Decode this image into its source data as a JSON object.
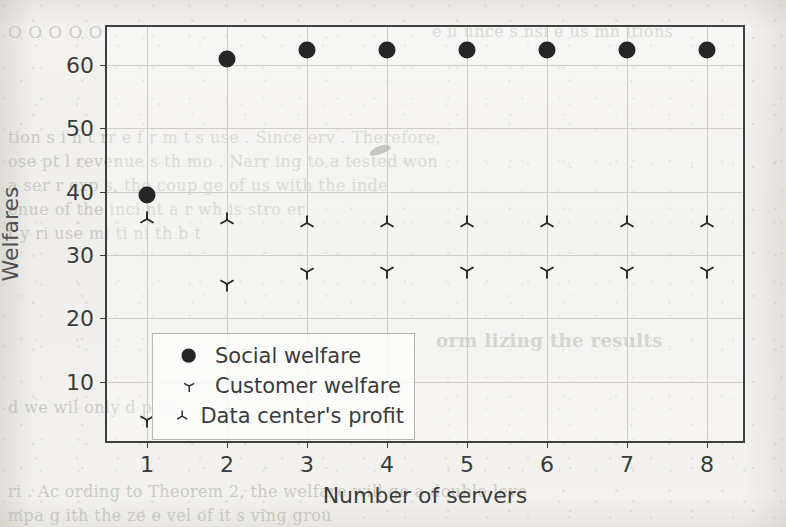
{
  "page": {
    "width": 786,
    "height": 527,
    "background_color": "#f2f1ee",
    "ghost_text_color": "#bfbcb4"
  },
  "background_text": [
    {
      "text": "O   O                             O   O                                   O",
      "x": 8,
      "y": 22,
      "size": 17,
      "bold": false
    },
    {
      "text": "e   u   unce   s  nsi  e   us  mn     itions",
      "x": 432,
      "y": 22,
      "size": 16,
      "bold": false
    },
    {
      "text": "tion s  i   n   t   rr e  f r m   t  s   use  .  Since    erv   . Therefore,",
      "x": 8,
      "y": 128,
      "size": 16,
      "bold": false
    },
    {
      "text": "ose   pt  l  revenue  s  th  mo  . Narr  ing  to a  tested   won",
      "x": 8,
      "y": 152,
      "size": 16,
      "bold": false
    },
    {
      "text": "a   ser   r  exp  s,  the  coup  ge  of  us   with  the   inde",
      "x": 8,
      "y": 176,
      "size": 16,
      "bold": false
    },
    {
      "text": "enue  of  the  inci  nt   a   r   wh   is   stro   er",
      "x": 8,
      "y": 200,
      "size": 16,
      "bold": false
    },
    {
      "text": "t    y    ri   use     mi      ti     ni          th    b    t",
      "x": 8,
      "y": 224,
      "size": 16,
      "bold": false
    },
    {
      "text": "orm lizing  the  results",
      "x": 436,
      "y": 330,
      "size": 18,
      "bold": true
    },
    {
      "text": "d  we   wil   only   d  pen",
      "x": 8,
      "y": 398,
      "size": 16,
      "bold": false
    },
    {
      "text": "ri  .  Ac  ording  to  Theorem  2,  the   welfare  will  ge  a  double  leve",
      "x": 8,
      "y": 482,
      "size": 16,
      "bold": false
    },
    {
      "text": "mpa   g   ith  the  ze  e  vel  of  it  s   ving  grou",
      "x": 8,
      "y": 506,
      "size": 16,
      "bold": false
    }
  ],
  "chart_data": {
    "type": "scatter",
    "title": "",
    "xlabel": "Number of servers",
    "ylabel": "Welfares",
    "x": [
      1,
      2,
      3,
      4,
      5,
      6,
      7,
      8
    ],
    "xlim": [
      0.5,
      8.5
    ],
    "ylim": [
      0.0,
      66.0
    ],
    "xticks": [
      1,
      2,
      3,
      4,
      5,
      6,
      7,
      8
    ],
    "xticklabels": [
      "1",
      "2",
      "3",
      "4",
      "5",
      "6",
      "7",
      "8"
    ],
    "yticks": [
      10,
      20,
      30,
      40,
      50,
      60
    ],
    "yticklabels": [
      "10",
      "20",
      "30",
      "40",
      "50",
      "60"
    ],
    "grid": true,
    "legend_position": "lower left",
    "marker_color": "#262626",
    "series": [
      {
        "name": "Social welfare",
        "marker": "filled-circle",
        "values": [
          39.5,
          60.9,
          62.3,
          62.4,
          62.4,
          62.4,
          62.4,
          62.4
        ]
      },
      {
        "name": "Customer welfare",
        "marker": "tri-down",
        "values": [
          3.9,
          25.4,
          27.3,
          27.4,
          27.4,
          27.4,
          27.4,
          27.4
        ]
      },
      {
        "name": "Data center's profit",
        "marker": "tri-up",
        "values": [
          35.7,
          35.6,
          35.1,
          35.0,
          35.0,
          35.0,
          35.0,
          35.0
        ]
      }
    ]
  },
  "legend": {
    "entries": [
      {
        "label": "Social welfare",
        "marker": "filled-circle"
      },
      {
        "label": "Customer welfare",
        "marker": "tri-down"
      },
      {
        "label": "Data center's profit",
        "marker": "tri-up"
      }
    ]
  }
}
